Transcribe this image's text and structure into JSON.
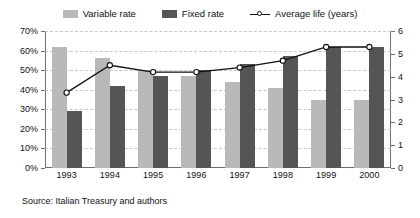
{
  "legend": {
    "items": [
      {
        "label": "Variable rate",
        "key": "variable",
        "color": "#b9b9b9",
        "icon": "square-swatch-icon"
      },
      {
        "label": "Fixed rate",
        "key": "fixed",
        "color": "#555555",
        "icon": "square-swatch-icon"
      },
      {
        "label": "Average life (years)",
        "key": "average_life",
        "color": "#111111",
        "icon": "line-marker-icon"
      }
    ]
  },
  "source": {
    "text": "Source: Italian Treasury and authors"
  },
  "chart_data": {
    "type": "bar",
    "title": "",
    "subtitle": "",
    "xlabel": "",
    "ylabel": "",
    "y2label": "",
    "categories": [
      "1993",
      "1994",
      "1995",
      "1996",
      "1997",
      "1998",
      "1999",
      "2000"
    ],
    "ylim": [
      0,
      70
    ],
    "yticks": [
      0,
      10,
      20,
      30,
      40,
      50,
      60,
      70
    ],
    "ytick_labels": [
      "0%",
      "10%",
      "20%",
      "30%",
      "40%",
      "50%",
      "60%",
      "70%"
    ],
    "y2lim": [
      0,
      6
    ],
    "y2ticks": [
      0,
      1,
      2,
      3,
      4,
      5,
      6
    ],
    "y2tick_labels": [
      "0",
      "1",
      "2",
      "3",
      "4",
      "5",
      "6"
    ],
    "grid": true,
    "grid_style": "dashed-horizontal",
    "legend_position": "top-center",
    "series": [
      {
        "name": "Variable rate",
        "kind": "bar",
        "axis": "left",
        "unit": "%",
        "color": "#b9b9b9",
        "values": [
          62,
          56,
          50,
          47,
          44,
          41,
          35,
          35
        ]
      },
      {
        "name": "Fixed rate",
        "kind": "bar",
        "axis": "left",
        "unit": "%",
        "color": "#555555",
        "values": [
          29,
          42,
          47,
          50,
          53,
          57,
          62,
          62
        ]
      },
      {
        "name": "Average life (years)",
        "kind": "line",
        "axis": "right",
        "unit": "years",
        "color": "#111111",
        "marker": "open-circle",
        "values": [
          3.3,
          4.5,
          4.2,
          4.2,
          4.4,
          4.7,
          5.3,
          5.3
        ]
      }
    ]
  }
}
